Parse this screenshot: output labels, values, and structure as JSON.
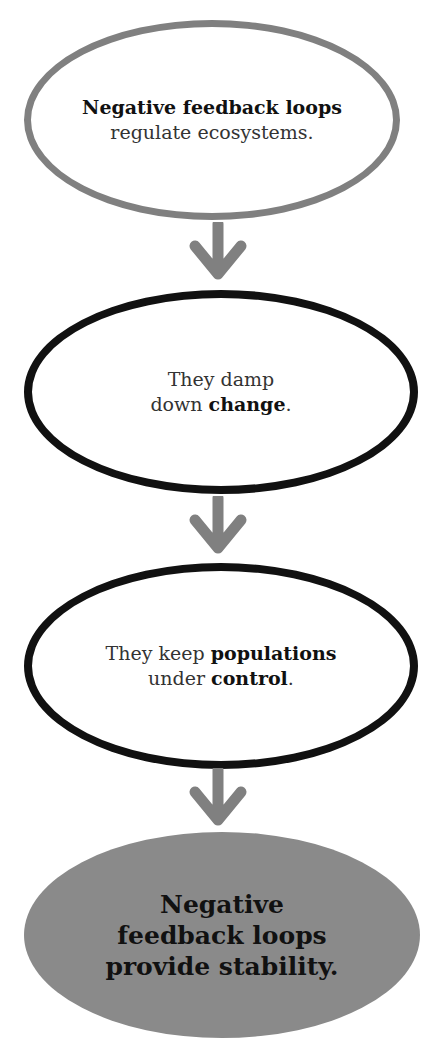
{
  "diagram": {
    "type": "flowchart-vertical",
    "colors": {
      "first_outline": "#808080",
      "outline": "#111111",
      "arrow": "#808080",
      "final_fill": "#8a8a8a"
    },
    "nodes": [
      {
        "bold": "Negative feedback loops",
        "rest": "regulate ecosystems."
      },
      {
        "line1": "They damp",
        "line2_pre": "down ",
        "line2_bold": "change",
        "line2_post": "."
      },
      {
        "line1_pre": "They keep ",
        "line1_bold": "populations",
        "line2_pre": "under ",
        "line2_bold": "control",
        "line2_post": "."
      },
      {
        "line1": "Negative",
        "line2": "feedback loops",
        "line3": "provide stability."
      }
    ],
    "arrow_icon": "down-arrow-icon"
  }
}
